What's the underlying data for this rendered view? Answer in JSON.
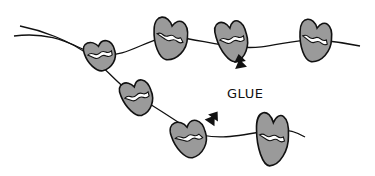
{
  "illustration": {
    "description": "Hand-drawn beans/seeds glued onto two strings",
    "label": "GLUE",
    "colors": {
      "bean_fill": "#9a9a9a",
      "outline": "#111111",
      "glue": "#ffffff",
      "background": "#ffffff"
    },
    "strings": [
      {
        "name": "upper-string",
        "path": "M 14 36 C 60 30, 80 52, 100 55 C 130 58, 150 35, 175 37 C 200 40, 215 45, 240 47 C 270 50, 290 38, 320 40 C 340 42, 355 45, 360 46"
      },
      {
        "name": "lower-string",
        "path": "M 20 26 C 40 30, 70 40, 90 56 C 110 72, 120 88, 140 98 C 160 110, 175 120, 190 130 C 210 142, 240 136, 270 130 C 290 128, 300 134, 305 137"
      }
    ],
    "beans": [
      {
        "name": "bean-1",
        "cx": 100,
        "cy": 55,
        "rx": 16,
        "ry": 16,
        "rot": -10
      },
      {
        "name": "bean-2",
        "cx": 170,
        "cy": 38,
        "rx": 18,
        "ry": 22,
        "rot": 10
      },
      {
        "name": "bean-3",
        "cx": 232,
        "cy": 40,
        "rx": 16,
        "ry": 22,
        "rot": -10
      },
      {
        "name": "bean-4",
        "cx": 315,
        "cy": 40,
        "rx": 17,
        "ry": 22,
        "rot": 10
      },
      {
        "name": "bean-5",
        "cx": 137,
        "cy": 97,
        "rx": 16,
        "ry": 19,
        "rot": -15
      },
      {
        "name": "bean-6",
        "cx": 189,
        "cy": 138,
        "rx": 18,
        "ry": 20,
        "rot": -10
      },
      {
        "name": "bean-7",
        "cx": 272,
        "cy": 138,
        "rx": 17,
        "ry": 28,
        "rot": 5
      }
    ],
    "arrows": [
      {
        "name": "arrow-upper",
        "x": 240,
        "y": 62,
        "rot": -10
      },
      {
        "name": "arrow-lower",
        "x": 213,
        "y": 118,
        "rot": 35
      }
    ]
  }
}
